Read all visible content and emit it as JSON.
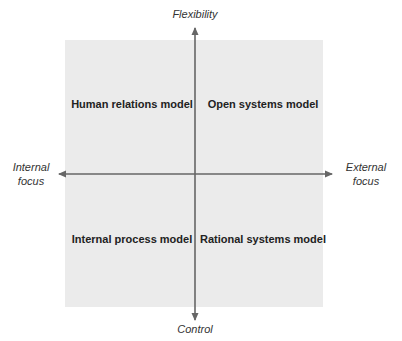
{
  "diagram": {
    "type": "quadrant",
    "axes": {
      "top": "Flexibility",
      "bottom": "Control",
      "left": "Internal\nfocus",
      "right": "External\nfocus"
    },
    "quadrants": {
      "top_left": "Human relations model",
      "top_right": "Open systems model",
      "bottom_left": "Internal process model",
      "bottom_right": "Rational systems model"
    },
    "colors": {
      "background": "#ffffff",
      "quadrant_fill": "#ebebeb",
      "axis_line": "#666666",
      "text": "#222222"
    }
  }
}
